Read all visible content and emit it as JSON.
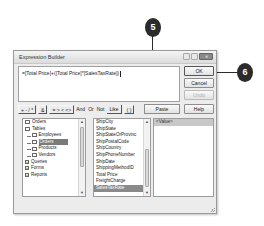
{
  "callouts": [
    {
      "label": "5"
    },
    {
      "label": "6"
    }
  ],
  "dialog": {
    "title": "Expression Builder",
    "window_buttons": {
      "minimize": "",
      "maximize": "",
      "close": "✕"
    },
    "expression": "=[Total Price]+([Total Price]*[SalesTaxRate])",
    "buttons": {
      "ok": "OK",
      "cancel": "Cancel",
      "undo": "Undo",
      "paste": "Paste",
      "help": "Help"
    },
    "operators": {
      "arith": "+ - / *",
      "concat": "&",
      "compare": "= > < <>",
      "and": "And",
      "or": "Or",
      "not": "Not",
      "like": "Like",
      "parens": "( )"
    },
    "tree": [
      {
        "label": "Orders",
        "icon": "folder-icon",
        "level": 0
      },
      {
        "label": "Tables",
        "icon": "folder-open-icon",
        "level": 0
      },
      {
        "label": "Employees",
        "icon": "folder-icon",
        "level": 1
      },
      {
        "label": "Orders",
        "icon": "folder-open-icon",
        "level": 1,
        "selected": true
      },
      {
        "label": "Products",
        "icon": "folder-icon",
        "level": 1
      },
      {
        "label": "Vendors",
        "icon": "folder-icon",
        "level": 1
      },
      {
        "label": "Queries",
        "icon": "plus-icon",
        "level": 0
      },
      {
        "label": "Forms",
        "icon": "plus-icon",
        "level": 0
      },
      {
        "label": "Reports",
        "icon": "plus-icon",
        "level": 0
      }
    ],
    "fields": [
      "ShipCity",
      "ShipState",
      "ShipStateOrProvinc",
      "ShipPostalCode",
      "ShipCountry",
      "ShipPhoneNumber",
      "ShipDate",
      "ShippingMethodID",
      "Total Price",
      "FreightCharge",
      "SalesTaxRate"
    ],
    "selected_field": "SalesTaxRate",
    "values": [
      "<Value>"
    ]
  }
}
